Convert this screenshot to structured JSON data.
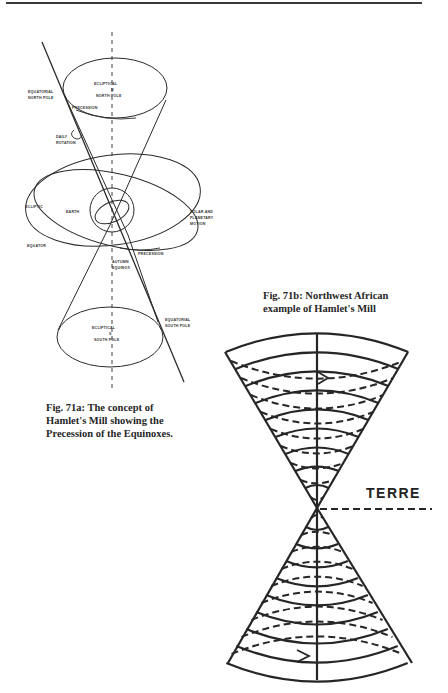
{
  "figure_a": {
    "labels": {
      "ecliptical_north_pole_1": "ECLIPTICAL",
      "ecliptical_north_pole_2": "N",
      "ecliptical_north_pole_3": "NORTH POLE",
      "equatorial_north_pole_1": "EQUATORIAL",
      "equatorial_north_pole_2": "NORTH POLE",
      "precession_top": "PRECESSION",
      "daily_rotation_1": "DAILY",
      "daily_rotation_2": "ROTATION",
      "ecliptic": "ECLIPTIC",
      "earth": "EARTH",
      "solar_motion_1": "SOLAR AND",
      "solar_motion_2": "PLANETARY",
      "solar_motion_3": "MOTION",
      "equator": "EQUATOR",
      "precession_mid": "PRECESSION",
      "autumn_equinox_1": "AUTUMN",
      "autumn_equinox_2": "EQUINOX",
      "ecliptical_south_pole_1": "ECLIPTICAL",
      "ecliptical_south_pole_2": "S",
      "ecliptical_south_pole_3": "SOUTH POLE",
      "equatorial_south_pole_1": "EQUATORIAL",
      "equatorial_south_pole_2": "SOUTH POLE"
    },
    "caption": [
      "Fig. 71a: The concept of",
      "Hamlet's Mill showing the",
      "Precession of the Equinoxes."
    ]
  },
  "figure_b": {
    "caption": [
      "Fig. 71b: Northwest African",
      "example of Hamlet's Mill"
    ],
    "label_terre": "TERRE"
  }
}
